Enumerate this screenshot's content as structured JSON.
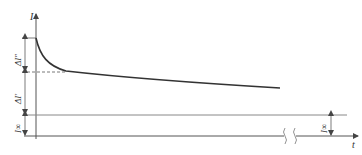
{
  "diagram": {
    "type": "short-circuit current decay",
    "y_axis_label": "I",
    "x_axis_label": "t",
    "labels": {
      "delta_subtransient": "ΔI″",
      "delta_transient": "ΔI′",
      "steady_state_left": "I∞",
      "steady_state_right": "I∞"
    },
    "colors": {
      "curve": "#333333",
      "axis": "#555555",
      "reference": "#888888"
    }
  }
}
